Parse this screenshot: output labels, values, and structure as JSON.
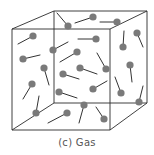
{
  "caption": {
    "label": "(c)  Gas"
  },
  "colors": {
    "background": "#ffffff",
    "edge": "#2b2b2b",
    "molecule": "#7a7a7a",
    "tail": "#333333",
    "caption": "#555555"
  },
  "cube": {
    "front": {
      "tl": [
        12,
        29
      ],
      "tr": [
        110,
        29
      ],
      "br": [
        110,
        130
      ],
      "bl": [
        12,
        130
      ]
    },
    "back": {
      "tl": [
        54,
        11
      ],
      "tr": [
        147,
        11
      ],
      "br": [
        147,
        103
      ],
      "bl": [
        54,
        103
      ]
    }
  },
  "molecules": [
    {
      "ball": [
        68,
        26
      ],
      "tail": [
        57,
        13
      ]
    },
    {
      "ball": [
        93,
        17
      ],
      "tail": [
        75,
        23
      ]
    },
    {
      "ball": [
        117,
        22
      ],
      "tail": [
        100,
        22
      ]
    },
    {
      "ball": [
        33,
        36
      ],
      "tail": [
        18,
        44
      ]
    },
    {
      "ball": [
        96,
        39
      ],
      "tail": [
        78,
        39
      ]
    },
    {
      "ball": [
        137,
        33
      ],
      "tail": [
        143,
        47
      ]
    },
    {
      "ball": [
        53,
        50
      ],
      "tail": [
        68,
        42
      ]
    },
    {
      "ball": [
        77,
        52
      ],
      "tail": [
        60,
        62
      ]
    },
    {
      "ball": [
        123,
        47
      ],
      "tail": [
        124,
        31
      ]
    },
    {
      "ball": [
        23,
        59
      ],
      "tail": [
        40,
        55
      ]
    },
    {
      "ball": [
        80,
        68
      ],
      "tail": [
        97,
        74
      ]
    },
    {
      "ball": [
        106,
        69
      ],
      "tail": [
        97,
        53
      ]
    },
    {
      "ball": [
        130,
        65
      ],
      "tail": [
        132,
        82
      ]
    },
    {
      "ball": [
        44,
        68
      ],
      "tail": [
        49,
        85
      ]
    },
    {
      "ball": [
        63,
        74
      ],
      "tail": [
        79,
        79
      ]
    },
    {
      "ball": [
        32,
        84
      ],
      "tail": [
        23,
        99
      ]
    },
    {
      "ball": [
        93,
        89
      ],
      "tail": [
        107,
        81
      ]
    },
    {
      "ball": [
        59,
        92
      ],
      "tail": [
        77,
        98
      ]
    },
    {
      "ball": [
        121,
        93
      ],
      "tail": [
        115,
        77
      ]
    },
    {
      "ball": [
        139,
        102
      ],
      "tail": [
        143,
        86
      ]
    },
    {
      "ball": [
        84,
        105
      ],
      "tail": [
        79,
        123
      ]
    },
    {
      "ball": [
        36,
        113
      ],
      "tail": [
        39,
        96
      ]
    },
    {
      "ball": [
        67,
        113
      ],
      "tail": [
        48,
        123
      ]
    },
    {
      "ball": [
        104,
        119
      ],
      "tail": [
        96,
        107
      ]
    }
  ],
  "molecule_radius": 3.6
}
